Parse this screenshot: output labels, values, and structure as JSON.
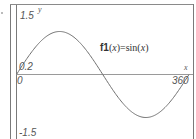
{
  "chart_data": {
    "type": "line",
    "title": "",
    "function_label": {
      "name": "f1",
      "arg": "x",
      "expr_fn": "sin",
      "expr_arg": "x",
      "full": "f1(x)=sin(x)"
    },
    "xlabel": "x",
    "ylabel": "y",
    "xlim": [
      0,
      360
    ],
    "ylim": [
      -1.5,
      1.5
    ],
    "grid": false,
    "tick_labels": {
      "y_max": "1.5",
      "y_min": "-1.5",
      "y_near_zero": "0.2",
      "x_min": "0",
      "x_max": "360"
    },
    "series": [
      {
        "name": "f1(x)=sin(x)",
        "x": [
          0,
          30,
          60,
          90,
          120,
          150,
          180,
          210,
          240,
          270,
          300,
          330,
          360
        ],
        "y": [
          0,
          0.5,
          0.866,
          1,
          0.866,
          0.5,
          0,
          -0.5,
          -0.866,
          -1,
          -0.866,
          -0.5,
          0
        ]
      }
    ]
  },
  "colors": {
    "curve": "#707070",
    "axis": "#8a8a8a",
    "frame": "#7a7a7a",
    "text": "#555555"
  }
}
